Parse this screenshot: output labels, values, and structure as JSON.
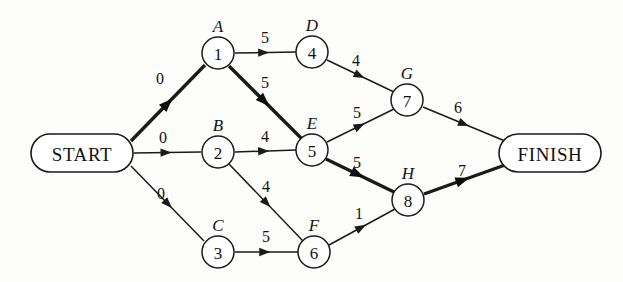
{
  "diagram": {
    "type": "directed-weighted-network",
    "colors": {
      "background": "#fdfdfc",
      "stroke": "#1a1a1a",
      "node_fill": "#ffffff",
      "critical_stroke": "#0d0d0d"
    },
    "terminals": [
      {
        "id": "start",
        "label": "START",
        "cx": 82,
        "cy": 153,
        "rx": 51,
        "ry": 19
      },
      {
        "id": "finish",
        "label": "FINISH",
        "cx": 550,
        "cy": 153,
        "rx": 51,
        "ry": 19
      }
    ],
    "nodes": [
      {
        "id": "n1",
        "number": "1",
        "letter": "A",
        "cx": 218,
        "cy": 53,
        "r": 16
      },
      {
        "id": "n2",
        "number": "2",
        "letter": "B",
        "cx": 218,
        "cy": 152,
        "r": 16
      },
      {
        "id": "n3",
        "number": "3",
        "letter": "C",
        "cx": 218,
        "cy": 252,
        "r": 16
      },
      {
        "id": "n4",
        "number": "4",
        "letter": "D",
        "cx": 312,
        "cy": 52,
        "r": 16
      },
      {
        "id": "n5",
        "number": "5",
        "letter": "E",
        "cx": 312,
        "cy": 150,
        "r": 16
      },
      {
        "id": "n6",
        "number": "6",
        "letter": "F",
        "cx": 314,
        "cy": 252,
        "r": 16
      },
      {
        "id": "n7",
        "number": "7",
        "letter": "G",
        "cx": 407,
        "cy": 100,
        "r": 16
      },
      {
        "id": "n8",
        "number": "8",
        "letter": "H",
        "cx": 408,
        "cy": 200,
        "r": 16
      }
    ],
    "edges": [
      {
        "id": "e-start-1",
        "from": "START",
        "to": "1",
        "weight": "0",
        "critical": true,
        "x1": 131,
        "y1": 141,
        "x2": 205,
        "y2": 65,
        "lx": 160,
        "ly": 84
      },
      {
        "id": "e-start-2",
        "from": "START",
        "to": "2",
        "weight": "0",
        "critical": false,
        "x1": 134,
        "y1": 153,
        "x2": 201,
        "y2": 152,
        "lx": 163,
        "ly": 143
      },
      {
        "id": "e-start-3",
        "from": "START",
        "to": "3",
        "weight": "0",
        "critical": false,
        "x1": 131,
        "y1": 166,
        "x2": 204,
        "y2": 241,
        "lx": 161,
        "ly": 199
      },
      {
        "id": "e-1-4",
        "from": "1",
        "to": "4",
        "weight": "5",
        "critical": false,
        "x1": 235,
        "y1": 53,
        "x2": 296,
        "y2": 52,
        "lx": 265,
        "ly": 43
      },
      {
        "id": "e-1-5",
        "from": "1",
        "to": "5",
        "weight": "5",
        "critical": true,
        "x1": 229,
        "y1": 66,
        "x2": 301,
        "y2": 138,
        "lx": 265,
        "ly": 88
      },
      {
        "id": "e-2-5",
        "from": "2",
        "to": "5",
        "weight": "4",
        "critical": false,
        "x1": 235,
        "y1": 152,
        "x2": 296,
        "y2": 150,
        "lx": 265,
        "ly": 142
      },
      {
        "id": "e-2-6",
        "from": "2",
        "to": "6",
        "weight": "4",
        "critical": false,
        "x1": 229,
        "y1": 164,
        "x2": 303,
        "y2": 241,
        "lx": 266,
        "ly": 192
      },
      {
        "id": "e-3-6",
        "from": "3",
        "to": "6",
        "weight": "5",
        "critical": false,
        "x1": 235,
        "y1": 252,
        "x2": 298,
        "y2": 252,
        "lx": 266,
        "ly": 242
      },
      {
        "id": "e-4-7",
        "from": "4",
        "to": "7",
        "weight": "4",
        "critical": false,
        "x1": 327,
        "y1": 60,
        "x2": 394,
        "y2": 92,
        "lx": 356,
        "ly": 66
      },
      {
        "id": "e-5-7",
        "from": "5",
        "to": "7",
        "weight": "5",
        "critical": false,
        "x1": 327,
        "y1": 142,
        "x2": 394,
        "y2": 109,
        "lx": 357,
        "ly": 118
      },
      {
        "id": "e-5-8",
        "from": "5",
        "to": "8",
        "weight": "5",
        "critical": true,
        "x1": 326,
        "y1": 159,
        "x2": 394,
        "y2": 192,
        "lx": 357,
        "ly": 168
      },
      {
        "id": "e-6-8",
        "from": "6",
        "to": "8",
        "weight": "1",
        "critical": false,
        "x1": 329,
        "y1": 245,
        "x2": 395,
        "y2": 209,
        "lx": 359,
        "ly": 219
      },
      {
        "id": "e-7-finish",
        "from": "7",
        "to": "FINISH",
        "weight": "6",
        "critical": false,
        "x1": 423,
        "y1": 107,
        "x2": 505,
        "y2": 141,
        "lx": 458,
        "ly": 113
      },
      {
        "id": "e-8-finish",
        "from": "8",
        "to": "FINISH",
        "weight": "7",
        "critical": true,
        "x1": 424,
        "y1": 194,
        "x2": 505,
        "y2": 165,
        "lx": 462,
        "ly": 176
      }
    ]
  }
}
